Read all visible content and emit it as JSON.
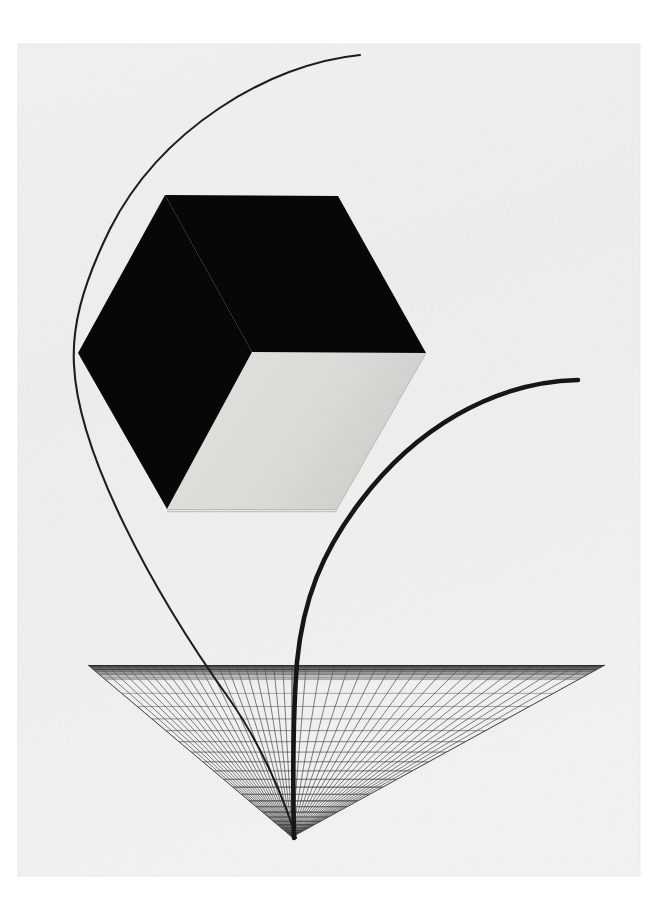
{
  "artwork": {
    "title": "Geometric Constructivist Composition",
    "medium_appearance": "printed-sheet-on-white-ground",
    "orientation": "portrait",
    "canvas": {
      "width": 662,
      "height": 918
    }
  },
  "palette": {
    "page_background": "#ffffff",
    "paper_ground": "#f1f0ee",
    "paper_ground_edge": "#e7e6e3",
    "solid_black": "#070707",
    "cube_face_light": "#dcdbd8",
    "cube_face_light_shadow": "#cfcecb",
    "cube_edge_line": "#b4b2ae",
    "arc_stroke": "#1a1a1a",
    "grid_stroke": "#555453",
    "grid_stroke_far": "#3a3a39",
    "horizon_band": "#4a4a49"
  },
  "elements": {
    "paper_sheet": {
      "name": "paper sheet",
      "x": 18,
      "y": 44,
      "width": 622,
      "height": 832
    },
    "cube": {
      "name": "isometric cube",
      "hex_vertices": [
        [
          165,
          195
        ],
        [
          338,
          196
        ],
        [
          426,
          353
        ],
        [
          337,
          509
        ],
        [
          167,
          509
        ],
        [
          78,
          353
        ]
      ],
      "center_vertex": [
        252,
        352
      ],
      "faces": [
        {
          "id": "top-face",
          "fill": "solid_black",
          "points": [
            [
              165,
              195
            ],
            [
              338,
              196
            ],
            [
              426,
              353
            ],
            [
              252,
              352
            ]
          ]
        },
        {
          "id": "left-face",
          "fill": "solid_black",
          "points": [
            [
              78,
              353
            ],
            [
              252,
              352
            ],
            [
              252,
              352
            ],
            [
              167,
              509
            ]
          ]
        },
        {
          "id": "right-face",
          "fill": "cube_face_light",
          "points": [
            [
              252,
              352
            ],
            [
              426,
              353
            ],
            [
              337,
              509
            ],
            [
              167,
              509
            ]
          ]
        }
      ],
      "left_face_points": [
        [
          78,
          353
        ],
        [
          165,
          195
        ],
        [
          252,
          352
        ],
        [
          167,
          509
        ]
      ],
      "right_face_points": [
        [
          252,
          352
        ],
        [
          426,
          353
        ],
        [
          337,
          509
        ],
        [
          167,
          509
        ]
      ]
    },
    "arc_thin": {
      "name": "thin descending arc",
      "stroke_width": 2.1,
      "start": [
        360,
        55
      ],
      "leftmost": [
        74,
        351
      ],
      "end": [
        296,
        838
      ],
      "description": "long slender arc sweeping from upper right, bowing out to the left past the cube, then curving down through the grid to the grid apex"
    },
    "arc_thick": {
      "name": "thick descending arc",
      "stroke_width": 4.6,
      "start": [
        578,
        380
      ],
      "knee": [
        310,
        600
      ],
      "end": [
        294,
        838
      ],
      "description": "heavier arc sweeping from the right edge down and left, then falling nearly vertically to the grid apex"
    },
    "grid_plane": {
      "name": "perspective grid plane",
      "left_corner": [
        88,
        665
      ],
      "right_corner": [
        605,
        665
      ],
      "apex": [
        292,
        837
      ],
      "horizon_y": 665,
      "rows": 26,
      "columns_left": 22,
      "columns_right": 22,
      "line_weight": 0.85
    }
  },
  "labels": {
    "top_arc": "thin-arc",
    "right_arc": "thick-arc",
    "solid_form": "cube-hexagon",
    "ground_plane": "grid-triangle"
  }
}
